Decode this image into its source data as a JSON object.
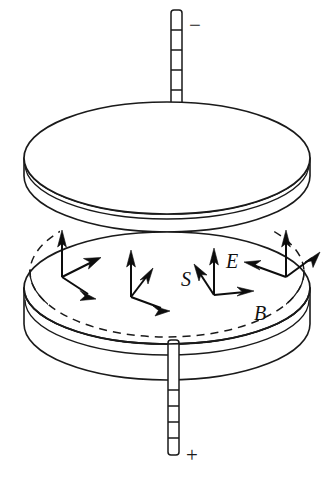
{
  "figure": {
    "kind": "physics-diagram",
    "background_color": "#ffffff",
    "ink_color": "#1a1a1a"
  },
  "terminals": {
    "top": {
      "name": "negative-terminal",
      "sign_label": "−",
      "segments": 8
    },
    "bottom": {
      "name": "positive-terminal",
      "sign_label": "+",
      "segments": 5
    }
  },
  "plates": {
    "top": {
      "name": "top-plate",
      "charge": "negative"
    },
    "bottom": {
      "name": "bottom-plate",
      "charge": "positive"
    }
  },
  "labels": {
    "electric_field": "E",
    "magnetic_field": "B",
    "poynting_vector": "S"
  },
  "vectors": {
    "electric_field": {
      "symbol": "E",
      "direction": "vertical-up",
      "count": 4
    },
    "magnetic_field": {
      "symbol": "B",
      "direction": "tangential-circular",
      "count": 4
    },
    "poynting_vector": {
      "symbol": "S",
      "direction": "radially-inward",
      "count": 4
    }
  },
  "field_boundary": {
    "name": "dashed-field-region",
    "style": "dashed-ellipse"
  }
}
